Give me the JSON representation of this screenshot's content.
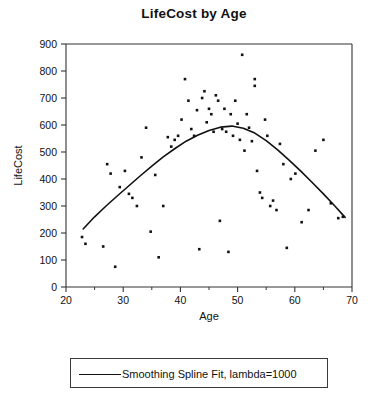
{
  "chart_data": {
    "type": "scatter",
    "title": "LifeCost by Age",
    "xlabel": "Age",
    "ylabel": "LifeCost",
    "xlim": [
      20,
      70
    ],
    "ylim": [
      0,
      900
    ],
    "xticks": [
      20,
      30,
      40,
      50,
      60,
      70
    ],
    "xtick_labels": [
      "20",
      "30",
      "40",
      "50",
      "60",
      "70"
    ],
    "xminor_ticks": [
      25,
      35,
      45,
      55,
      65
    ],
    "yticks": [
      0,
      100,
      200,
      300,
      400,
      500,
      600,
      700,
      800,
      900
    ],
    "ytick_labels": [
      "0",
      "100",
      "200",
      "300",
      "400",
      "500",
      "600",
      "700",
      "800",
      "900"
    ],
    "grid": false,
    "legend_position": "below-plot",
    "marker_color": "#111111",
    "line_color": "#111111",
    "series": [
      {
        "name": "LifeCost observations",
        "type": "scatter",
        "points": [
          [
            22.8,
            185
          ],
          [
            23.4,
            160
          ],
          [
            26.5,
            150
          ],
          [
            27.2,
            455
          ],
          [
            27.8,
            420
          ],
          [
            28.6,
            75
          ],
          [
            29.4,
            370
          ],
          [
            30.3,
            430
          ],
          [
            31.0,
            345
          ],
          [
            31.6,
            330
          ],
          [
            32.4,
            300
          ],
          [
            33.2,
            480
          ],
          [
            34.0,
            590
          ],
          [
            34.8,
            205
          ],
          [
            35.6,
            415
          ],
          [
            36.2,
            110
          ],
          [
            37.0,
            300
          ],
          [
            37.8,
            555
          ],
          [
            38.4,
            520
          ],
          [
            39.0,
            545
          ],
          [
            39.6,
            560
          ],
          [
            40.2,
            620
          ],
          [
            40.8,
            770
          ],
          [
            41.4,
            690
          ],
          [
            41.9,
            585
          ],
          [
            42.4,
            560
          ],
          [
            42.9,
            655
          ],
          [
            43.3,
            140
          ],
          [
            43.8,
            700
          ],
          [
            44.2,
            725
          ],
          [
            44.6,
            610
          ],
          [
            45.0,
            660
          ],
          [
            45.4,
            640
          ],
          [
            45.8,
            575
          ],
          [
            46.2,
            710
          ],
          [
            46.6,
            690
          ],
          [
            46.9,
            245
          ],
          [
            47.3,
            585
          ],
          [
            47.7,
            660
          ],
          [
            48.0,
            575
          ],
          [
            48.4,
            130
          ],
          [
            48.8,
            640
          ],
          [
            49.2,
            560
          ],
          [
            49.6,
            690
          ],
          [
            50.0,
            605
          ],
          [
            50.4,
            545
          ],
          [
            50.8,
            860
          ],
          [
            51.2,
            505
          ],
          [
            51.6,
            640
          ],
          [
            52.0,
            590
          ],
          [
            52.5,
            540
          ],
          [
            53.0,
            770
          ],
          [
            53.0,
            745
          ],
          [
            53.4,
            430
          ],
          [
            53.9,
            350
          ],
          [
            54.3,
            330
          ],
          [
            54.8,
            620
          ],
          [
            55.2,
            560
          ],
          [
            55.7,
            300
          ],
          [
            56.2,
            320
          ],
          [
            56.8,
            285
          ],
          [
            57.4,
            530
          ],
          [
            58.0,
            455
          ],
          [
            58.6,
            145
          ],
          [
            59.3,
            400
          ],
          [
            60.1,
            420
          ],
          [
            61.2,
            240
          ],
          [
            62.4,
            285
          ],
          [
            63.6,
            505
          ],
          [
            65.0,
            545
          ],
          [
            66.3,
            310
          ],
          [
            67.6,
            255
          ],
          [
            68.4,
            260
          ]
        ]
      },
      {
        "name": "Smoothing Spline Fit, lambda=1000",
        "type": "line",
        "points": [
          [
            23.0,
            215
          ],
          [
            25.0,
            260
          ],
          [
            27.0,
            300
          ],
          [
            29.0,
            338
          ],
          [
            31.0,
            375
          ],
          [
            33.0,
            412
          ],
          [
            35.0,
            448
          ],
          [
            37.0,
            482
          ],
          [
            39.0,
            512
          ],
          [
            41.0,
            540
          ],
          [
            43.0,
            562
          ],
          [
            45.0,
            580
          ],
          [
            47.0,
            592
          ],
          [
            49.0,
            596
          ],
          [
            51.0,
            588
          ],
          [
            53.0,
            570
          ],
          [
            55.0,
            542
          ],
          [
            57.0,
            508
          ],
          [
            59.0,
            470
          ],
          [
            61.0,
            430
          ],
          [
            63.0,
            388
          ],
          [
            65.0,
            345
          ],
          [
            67.0,
            300
          ],
          [
            68.8,
            258
          ]
        ]
      }
    ]
  },
  "legend": {
    "entry_label": "Smoothing Spline Fit, lambda=1000"
  }
}
